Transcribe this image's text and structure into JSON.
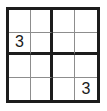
{
  "puzzle": {
    "type": "sudoku",
    "title": "4x4 Sudoku",
    "size": 4,
    "box_width": 2,
    "box_height": 2,
    "colors": {
      "background": "#ffffff",
      "outer_border": "#1c1c1c",
      "box_border": "#1c1c1c",
      "cell_border": "#8d8d8d",
      "digit": "#1a1a1a"
    },
    "rows": [
      {
        "cells": [
          {
            "value": ""
          },
          {
            "value": ""
          },
          {
            "value": ""
          },
          {
            "value": ""
          }
        ]
      },
      {
        "cells": [
          {
            "value": "3"
          },
          {
            "value": ""
          },
          {
            "value": ""
          },
          {
            "value": ""
          }
        ]
      },
      {
        "cells": [
          {
            "value": ""
          },
          {
            "value": ""
          },
          {
            "value": ""
          },
          {
            "value": ""
          }
        ]
      },
      {
        "cells": [
          {
            "value": ""
          },
          {
            "value": ""
          },
          {
            "value": ""
          },
          {
            "value": "3"
          }
        ]
      }
    ]
  }
}
